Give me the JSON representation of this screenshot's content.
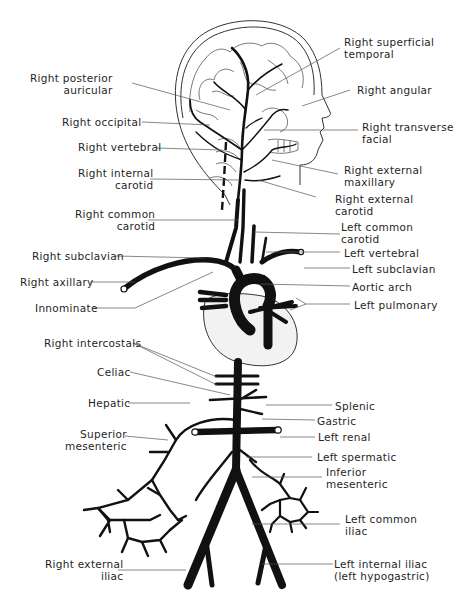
{
  "diagram": {
    "colors": {
      "vessel": "#111111",
      "leader": "#555555",
      "outline": "#333333",
      "heart_fill": "#f2f2f2"
    },
    "labels_left": [
      {
        "id": "right-posterior-auricular",
        "lines": [
          "Right posterior",
          "auricular"
        ]
      },
      {
        "id": "right-occipital",
        "lines": [
          "Right occipital"
        ]
      },
      {
        "id": "right-vertebral",
        "lines": [
          "Right vertebral"
        ]
      },
      {
        "id": "right-internal-carotid",
        "lines": [
          "Right internal",
          "carotid"
        ]
      },
      {
        "id": "right-common-carotid",
        "lines": [
          "Right common",
          "carotid"
        ]
      },
      {
        "id": "right-subclavian",
        "lines": [
          "Right subclavian"
        ]
      },
      {
        "id": "right-axillary",
        "lines": [
          "Right axillary"
        ]
      },
      {
        "id": "innominate",
        "lines": [
          "Innominate"
        ]
      },
      {
        "id": "right-intercostals",
        "lines": [
          "Right intercostals"
        ]
      },
      {
        "id": "celiac",
        "lines": [
          "Celiac"
        ]
      },
      {
        "id": "hepatic",
        "lines": [
          "Hepatic"
        ]
      },
      {
        "id": "superior-mesenteric",
        "lines": [
          "Superior",
          "mesenteric"
        ]
      },
      {
        "id": "right-external-iliac",
        "lines": [
          "Right external",
          "iliac"
        ]
      }
    ],
    "labels_right": [
      {
        "id": "right-superficial-temporal",
        "lines": [
          "Right superficial",
          "temporal"
        ]
      },
      {
        "id": "right-angular",
        "lines": [
          "Right angular"
        ]
      },
      {
        "id": "right-transverse-facial",
        "lines": [
          "Right transverse",
          "facial"
        ]
      },
      {
        "id": "right-external-maxillary",
        "lines": [
          "Right external",
          "maxillary"
        ]
      },
      {
        "id": "right-external-carotid",
        "lines": [
          "Right external",
          "carotid"
        ]
      },
      {
        "id": "left-common-carotid",
        "lines": [
          "Left common",
          "carotid"
        ]
      },
      {
        "id": "left-vertebral",
        "lines": [
          "Left vertebral"
        ]
      },
      {
        "id": "left-subclavian",
        "lines": [
          "Left subclavian"
        ]
      },
      {
        "id": "aortic-arch",
        "lines": [
          "Aortic arch"
        ]
      },
      {
        "id": "left-pulmonary",
        "lines": [
          "Left pulmonary"
        ]
      },
      {
        "id": "splenic",
        "lines": [
          "Splenic"
        ]
      },
      {
        "id": "gastric",
        "lines": [
          "Gastric"
        ]
      },
      {
        "id": "left-renal",
        "lines": [
          "Left renal"
        ]
      },
      {
        "id": "left-spermatic",
        "lines": [
          "Left spermatic"
        ]
      },
      {
        "id": "inferior-mesenteric",
        "lines": [
          "Inferior",
          "mesenteric"
        ]
      },
      {
        "id": "left-common-iliac",
        "lines": [
          "Left common",
          "iliac"
        ]
      },
      {
        "id": "left-internal-iliac",
        "lines": [
          "Left internal iliac",
          "(left hypogastric)"
        ]
      }
    ]
  }
}
